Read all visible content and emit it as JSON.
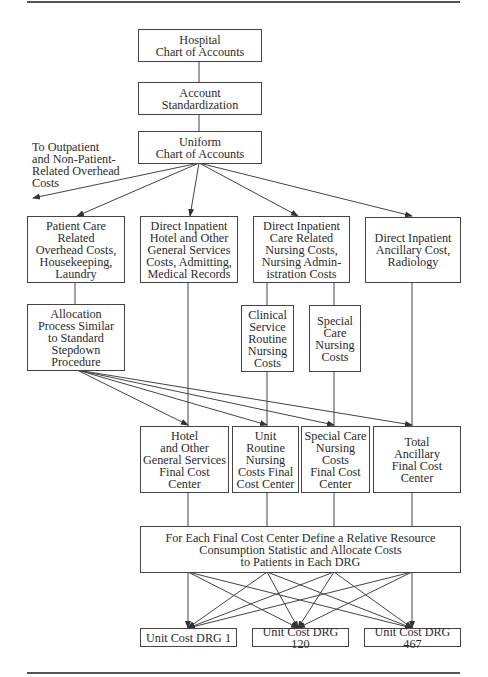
{
  "diagram": {
    "top": {
      "hospital_chart": "Hospital\nChart of Accounts",
      "account_standardization": "Account\nStandardization",
      "uniform_chart": "Uniform\nChart of Accounts"
    },
    "side_note": "To Outpatient\nand Non-Patient-\nRelated Overhead\nCosts",
    "cost_categories": [
      {
        "label": "Patient Care\nRelated\nOverhead Costs,\nHousekeeping,\nLaundry"
      },
      {
        "label": "Direct Inpatient\nHotel and Other\nGeneral Services\nCosts, Admitting,\nMedical Records"
      },
      {
        "label": "Direct Inpatient\nCare Related\nNursing Costs,\nNursing Admin-\nistration Costs"
      },
      {
        "label": "Direct Inpatient\nAncillary Cost,\nRadiology"
      }
    ],
    "sub_processes": {
      "allocation": "Allocation\nProcess Similar\nto Standard\nStepdown\nProcedure",
      "clinical_service": "Clinical\nService\nRoutine\nNursing\nCosts",
      "special_care": "Special\nCare\nNursing\nCosts"
    },
    "final_cost_centers": [
      {
        "label": "Hotel\nand Other\nGeneral Services\nFinal Cost\nCenter"
      },
      {
        "label": "Unit Routine\nNursing\nCosts Final\nCost Center"
      },
      {
        "label": "Special Care\nNursing\nCosts\nFinal Cost\nCenter"
      },
      {
        "label": "Total\nAncillary\nFinal Cost\nCenter"
      }
    ],
    "allocation_step": "For Each Final Cost Center Define a Relative Resource\nConsumption Statistic and Allocate Costs\nto Patients in Each DRG",
    "unit_costs": [
      {
        "label": "Unit Cost DRG 1"
      },
      {
        "label": "Unit Cost DRG 120"
      },
      {
        "label": "Unit Cost DRG 467"
      }
    ]
  }
}
